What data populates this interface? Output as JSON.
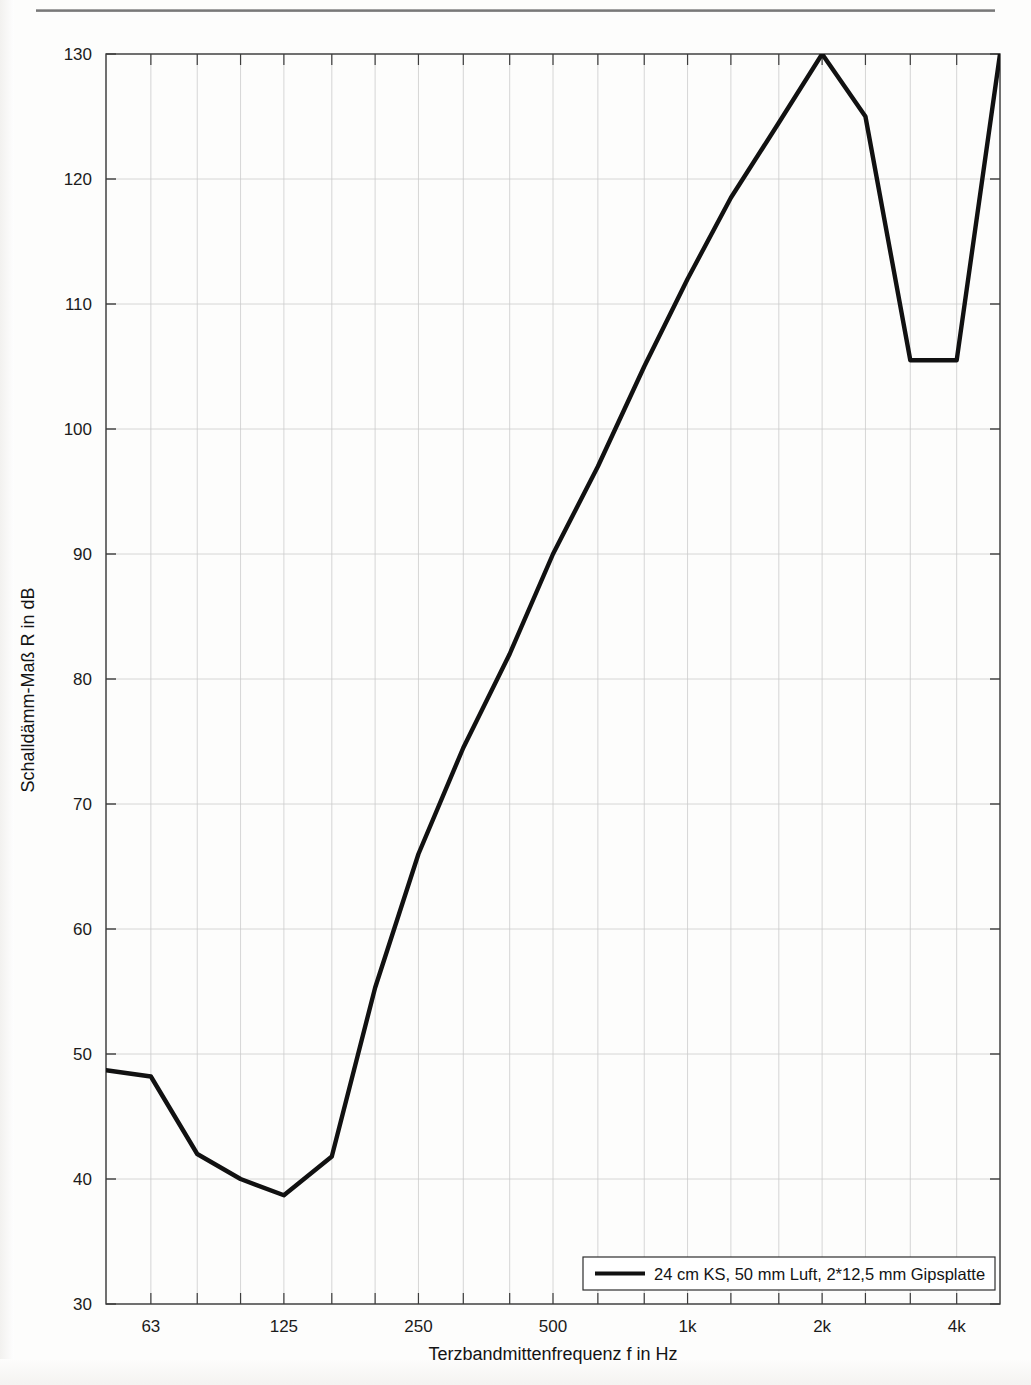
{
  "figure": {
    "kind": "line-chart",
    "background_color": "#fdfdfc",
    "line_color": "#111111",
    "axis_color": "#3d3d3d",
    "grid_color": "#cccccc"
  },
  "chart_data": {
    "type": "line",
    "title": "",
    "xlabel": "Terzbandmittenfrequenz f in Hz",
    "ylabel": "Schalldämm-Maß R in dB",
    "xscale": "log",
    "x_tick_labels": [
      "63",
      "125",
      "250",
      "500",
      "1k",
      "2k",
      "4k"
    ],
    "x_tick_values": [
      63,
      125,
      250,
      500,
      1000,
      2000,
      4000
    ],
    "y_tick_labels": [
      "30",
      "40",
      "50",
      "60",
      "70",
      "80",
      "90",
      "100",
      "110",
      "120",
      "130"
    ],
    "y_tick_values": [
      30,
      40,
      50,
      60,
      70,
      80,
      90,
      100,
      110,
      120,
      130
    ],
    "ylim": [
      30,
      130
    ],
    "xlim": [
      50,
      5000
    ],
    "grid": true,
    "legend_position": "bottom-right",
    "series": [
      {
        "name": "24 cm KS, 50 mm Luft, 2*12,5 mm Gipsplatte",
        "x": [
          50,
          63,
          80,
          100,
          125,
          160,
          200,
          250,
          315,
          400,
          500,
          630,
          800,
          1000,
          1250,
          1600,
          2000,
          2500,
          3150,
          4000,
          5000
        ],
        "values": [
          48.7,
          48.2,
          42.0,
          40.0,
          38.7,
          41.8,
          55.3,
          66.0,
          74.5,
          82.0,
          90.0,
          97.0,
          105.0,
          112.0,
          118.5,
          124.5,
          130.0,
          125.0,
          105.5,
          105.5,
          130.0
        ]
      }
    ]
  },
  "legend": {
    "entries": [
      {
        "label": "24 cm KS, 50 mm Luft, 2*12,5 mm Gipsplatte",
        "color": "#111111"
      }
    ]
  }
}
